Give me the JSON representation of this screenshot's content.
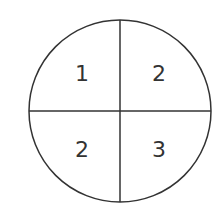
{
  "diagram": {
    "type": "circle-divided-into-quadrants",
    "stroke_color": "#333333",
    "background": "#ffffff",
    "circle": {
      "cx": 120,
      "cy": 111,
      "r": 91
    },
    "quadrants": [
      {
        "position": "top-left",
        "label": "1"
      },
      {
        "position": "top-right",
        "label": "2"
      },
      {
        "position": "bottom-left",
        "label": "2"
      },
      {
        "position": "bottom-right",
        "label": "3"
      }
    ]
  }
}
